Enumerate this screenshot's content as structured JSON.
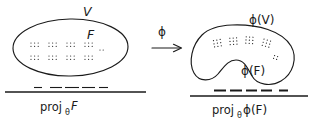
{
  "figure": {
    "background_color": "#ffffff",
    "ink_color": "#1a1a1a",
    "left_panel": {
      "region_label": "V",
      "subset_label": "F",
      "projection_label_prefix": "proj",
      "projection_label_subscript": "θ",
      "projection_label_argument": "F"
    },
    "map": {
      "label": "ϕ",
      "arrow": "→"
    },
    "right_panel": {
      "region_label": "ϕ(V)",
      "subset_label": "ϕ(F)",
      "projection_label_prefix": "proj",
      "projection_label_subscript": "θ",
      "projection_label_argument": "ϕ(F)"
    }
  },
  "chart_data": {
    "type": "diagram",
    "panels": [
      {
        "name": "source",
        "region_shape": "ellipse",
        "region_label": "V",
        "region_bbox": [
          13,
          19,
          128,
          76
        ],
        "subset_label": "F",
        "subset_label_pos": [
          91,
          36
        ],
        "axis_line": [
          5,
          92,
          146,
          92
        ],
        "axis_label": "projθ F",
        "projection_dashes": [
          [
            34,
            42
          ],
          [
            50,
            62
          ],
          [
            65,
            79
          ],
          [
            82,
            95
          ],
          [
            99,
            108
          ]
        ],
        "dash_style": "thin",
        "point_clusters": [
          {
            "origin": [
              31,
              43
            ],
            "cols": 3,
            "rows": 2,
            "dx": 3.6,
            "dy": 3.3
          },
          {
            "origin": [
              31,
              56
            ],
            "cols": 3,
            "rows": 2,
            "dx": 3.6,
            "dy": 3.3
          },
          {
            "origin": [
              49,
              43
            ],
            "cols": 3,
            "rows": 2,
            "dx": 3.6,
            "dy": 3.3
          },
          {
            "origin": [
              49,
              56
            ],
            "cols": 3,
            "rows": 2,
            "dx": 3.6,
            "dy": 3.3
          },
          {
            "origin": [
              67,
              43
            ],
            "cols": 3,
            "rows": 2,
            "dx": 3.6,
            "dy": 3.3
          },
          {
            "origin": [
              67,
              56
            ],
            "cols": 3,
            "rows": 2,
            "dx": 3.6,
            "dy": 3.3
          },
          {
            "origin": [
              85,
              43
            ],
            "cols": 3,
            "rows": 2,
            "dx": 3.6,
            "dy": 3.3
          },
          {
            "origin": [
              85,
              56
            ],
            "cols": 3,
            "rows": 2,
            "dx": 3.6,
            "dy": 3.3
          },
          {
            "origin": [
              100,
              50
            ],
            "cols": 2,
            "rows": 1,
            "dx": 3.2,
            "dy": 3.0
          }
        ]
      },
      {
        "name": "image",
        "region_shape": "kidney-blob",
        "region_label": "ϕ(V)",
        "region_label_pos": [
          259,
          22
        ],
        "region_bbox": [
          192,
          25,
          295,
          88
        ],
        "subset_label": "ϕ(F)",
        "subset_label_pos": [
          251,
          72
        ],
        "axis_line": [
          190,
          96,
          308,
          96
        ],
        "axis_label": "projθ ϕ(F)",
        "projection_dashes": [
          [
            214,
            226
          ],
          [
            230,
            242
          ],
          [
            246,
            257
          ],
          [
            261,
            272
          ],
          [
            279,
            288
          ]
        ],
        "dash_style": "bold",
        "point_clusters": [
          {
            "origin": [
              214,
              40
            ],
            "cols": 3,
            "rows": 3,
            "dx": 3.4,
            "dy": 3.2,
            "rot": -10
          },
          {
            "origin": [
              230,
              38
            ],
            "cols": 3,
            "rows": 3,
            "dx": 3.4,
            "dy": 3.2,
            "rot": -4
          },
          {
            "origin": [
              246,
              37
            ],
            "cols": 3,
            "rows": 3,
            "dx": 3.4,
            "dy": 3.2,
            "rot": 4
          },
          {
            "origin": [
              263,
              40
            ],
            "cols": 3,
            "rows": 3,
            "dx": 3.4,
            "dy": 3.2,
            "rot": 16
          },
          {
            "origin": [
              274,
              56
            ],
            "cols": 2,
            "rows": 2,
            "dx": 3.2,
            "dy": 3.0,
            "rot": 20
          }
        ]
      }
    ],
    "connector": {
      "label": "ϕ",
      "arrow_from": [
        152,
        48
      ],
      "arrow_to": [
        182,
        48
      ],
      "label_pos": [
        163,
        32
      ]
    }
  }
}
